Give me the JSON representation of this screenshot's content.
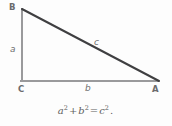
{
  "figure": {
    "background_color": "#fdfdfd",
    "vertices": [
      {
        "id": "B",
        "label": "B",
        "x": 22,
        "y": 9,
        "description": "top-left vertex"
      },
      {
        "id": "C",
        "label": "C",
        "x": 22,
        "y": 81,
        "description": "bottom-left vertex, right angle"
      },
      {
        "id": "A",
        "label": "A",
        "x": 158,
        "y": 81,
        "description": "bottom-right vertex"
      }
    ],
    "sides": [
      {
        "id": "a",
        "label": "a",
        "from": "B",
        "to": "C",
        "orientation": "vertical",
        "color": "#9a9a9c",
        "width": 2
      },
      {
        "id": "b",
        "label": "b",
        "from": "C",
        "to": "A",
        "orientation": "horizontal",
        "color": "#9a9a9c",
        "width": 2
      },
      {
        "id": "c",
        "label": "c",
        "from": "B",
        "to": "A",
        "orientation": "hypotenuse",
        "color": "#3f3f41",
        "width": 2
      }
    ],
    "equation": {
      "a_base": "a",
      "a_exp": "2",
      "plus": "+",
      "b_base": "b",
      "b_exp": "2",
      "equals": "=",
      "c_base": "c",
      "c_exp": "2",
      "period": "."
    }
  }
}
